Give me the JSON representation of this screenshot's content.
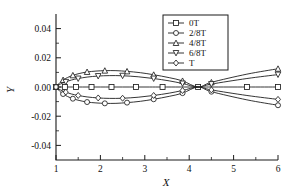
{
  "chart_data": {
    "type": "line",
    "title": "",
    "xlabel": "X",
    "ylabel": "Y",
    "xlim": [
      1,
      6
    ],
    "ylim": [
      -0.05,
      0.05
    ],
    "xticks": [
      1,
      2,
      3,
      4,
      5,
      6
    ],
    "xticklabels": [
      "1",
      "2",
      "3",
      "4",
      "5",
      "6"
    ],
    "yticks": [
      -0.04,
      -0.02,
      0.0,
      0.02,
      0.04
    ],
    "yticklabels": [
      "-0.04",
      "-0.02",
      "0.00",
      "0.02",
      "0.04"
    ],
    "grid": false,
    "legend_position": "top-center-right",
    "series": [
      {
        "name": "0T",
        "marker": "square",
        "x": [
          1.0,
          1.1,
          1.2,
          1.3,
          1.45,
          1.6,
          1.8,
          2.0,
          2.25,
          2.5,
          2.8,
          3.1,
          3.4,
          3.8,
          4.2,
          4.5,
          5.3,
          6.0
        ],
        "y": [
          0.0,
          0.0,
          0.0,
          0.0,
          0.0,
          0.0,
          0.0,
          0.0,
          0.0,
          0.0,
          0.0,
          0.0,
          0.0,
          0.0,
          0.0,
          0.0,
          0.0,
          0.0
        ]
      },
      {
        "name": "2/8T",
        "marker": "circle",
        "x": [
          1.0,
          1.08,
          1.16,
          1.26,
          1.38,
          1.52,
          1.7,
          1.9,
          2.1,
          2.35,
          2.6,
          2.9,
          3.2,
          3.55,
          3.85,
          4.2,
          4.5,
          5.3,
          6.0
        ],
        "y": [
          0.0,
          -0.0028,
          -0.0048,
          -0.0065,
          -0.008,
          -0.0092,
          -0.0103,
          -0.0109,
          -0.0112,
          -0.0112,
          -0.0107,
          -0.0098,
          -0.0084,
          -0.0064,
          -0.0042,
          0.0,
          -0.0032,
          -0.0088,
          -0.0125
        ]
      },
      {
        "name": "4/8T",
        "marker": "triangle-up",
        "x": [
          1.0,
          1.08,
          1.16,
          1.26,
          1.38,
          1.52,
          1.7,
          1.9,
          2.1,
          2.35,
          2.6,
          2.9,
          3.2,
          3.55,
          3.85,
          4.2,
          4.5,
          5.3,
          6.0
        ],
        "y": [
          0.0,
          0.0028,
          0.0048,
          0.0065,
          0.008,
          0.0092,
          0.0103,
          0.0109,
          0.0112,
          0.0112,
          0.0107,
          0.0098,
          0.0084,
          0.0064,
          0.0042,
          0.0,
          0.0032,
          0.0088,
          0.0125
        ]
      },
      {
        "name": "6/8T",
        "marker": "triangle-down",
        "x": [
          1.0,
          1.1,
          1.22,
          1.35,
          1.5,
          1.7,
          1.95,
          2.2,
          2.5,
          2.85,
          3.2,
          3.55,
          3.85,
          4.2,
          4.5,
          5.3,
          6.0
        ],
        "y": [
          0.0,
          0.002,
          0.0035,
          0.0048,
          0.0058,
          0.0068,
          0.0075,
          0.0078,
          0.0077,
          0.007,
          0.0058,
          0.0042,
          0.0024,
          0.0,
          0.002,
          0.0058,
          0.0085
        ]
      },
      {
        "name": "T",
        "marker": "diamond",
        "x": [
          1.0,
          1.1,
          1.22,
          1.35,
          1.5,
          1.7,
          1.95,
          2.2,
          2.5,
          2.85,
          3.2,
          3.55,
          3.85,
          4.2,
          4.5,
          5.3,
          6.0
        ],
        "y": [
          0.0,
          -0.002,
          -0.0035,
          -0.0048,
          -0.0058,
          -0.0068,
          -0.0075,
          -0.0078,
          -0.0077,
          -0.007,
          -0.0058,
          -0.0042,
          -0.0024,
          0.0,
          -0.002,
          -0.0058,
          -0.0085
        ]
      }
    ]
  },
  "legend": {
    "entries": [
      {
        "label": "0T"
      },
      {
        "label": "2/8T"
      },
      {
        "label": "4/8T"
      },
      {
        "label": "6/8T"
      },
      {
        "label": "T"
      }
    ]
  }
}
